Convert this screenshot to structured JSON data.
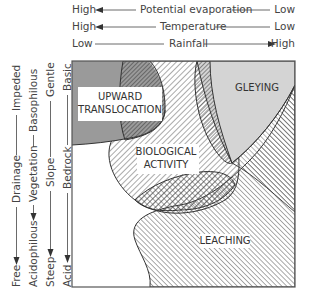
{
  "top_axes": [
    {
      "left": "High",
      "label": "Potential evaporation",
      "right": "Low",
      "arrow": "left"
    },
    {
      "left": "High",
      "label": "Temperature",
      "right": "Low",
      "arrow": "left"
    },
    {
      "left": "Low",
      "label": "Rainfall",
      "right": "High",
      "arrow": "right"
    }
  ],
  "side_axes": [
    {
      "bottom": "Free",
      "label": "Drainage",
      "top": "Impeded",
      "arrow": "down"
    },
    {
      "bottom": "Acidophilous",
      "label": "Vegetation",
      "top": "Basophilous",
      "arrow": "down"
    },
    {
      "bottom": "Steep",
      "label": "Slope",
      "top": "Gentle",
      "arrow": "down"
    },
    {
      "bottom": "Acid",
      "label": "Bedrock",
      "top": "Basic",
      "arrow": "down"
    }
  ],
  "zones": {
    "upward": {
      "line1": "UPWARD",
      "line2": "TRANSLOCATION"
    },
    "gleying": {
      "line1": "GLEYING"
    },
    "biological": {
      "line1": "BIOLOGICAL",
      "line2": "ACTIVITY"
    },
    "leaching": {
      "line1": "LEACHING"
    }
  },
  "colors": {
    "upward_fill": "#9a9a9a",
    "gleying_fill": "#d4d4d4",
    "outline": "#333333"
  }
}
